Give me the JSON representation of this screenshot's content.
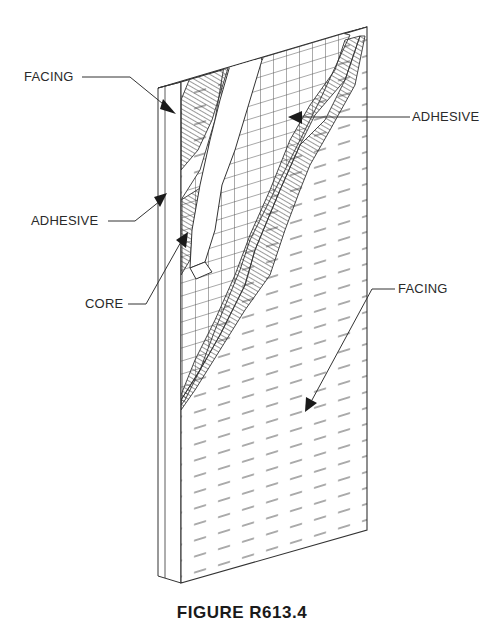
{
  "figure": {
    "caption": "FIGURE R613.4",
    "labels": {
      "facing_top": "FACING",
      "adhesive_right": "ADHESIVE",
      "adhesive_left": "ADHESIVE",
      "core": "CORE",
      "facing_bottom": "FACING"
    }
  },
  "colors": {
    "line": "#333333",
    "background": "#ffffff"
  }
}
